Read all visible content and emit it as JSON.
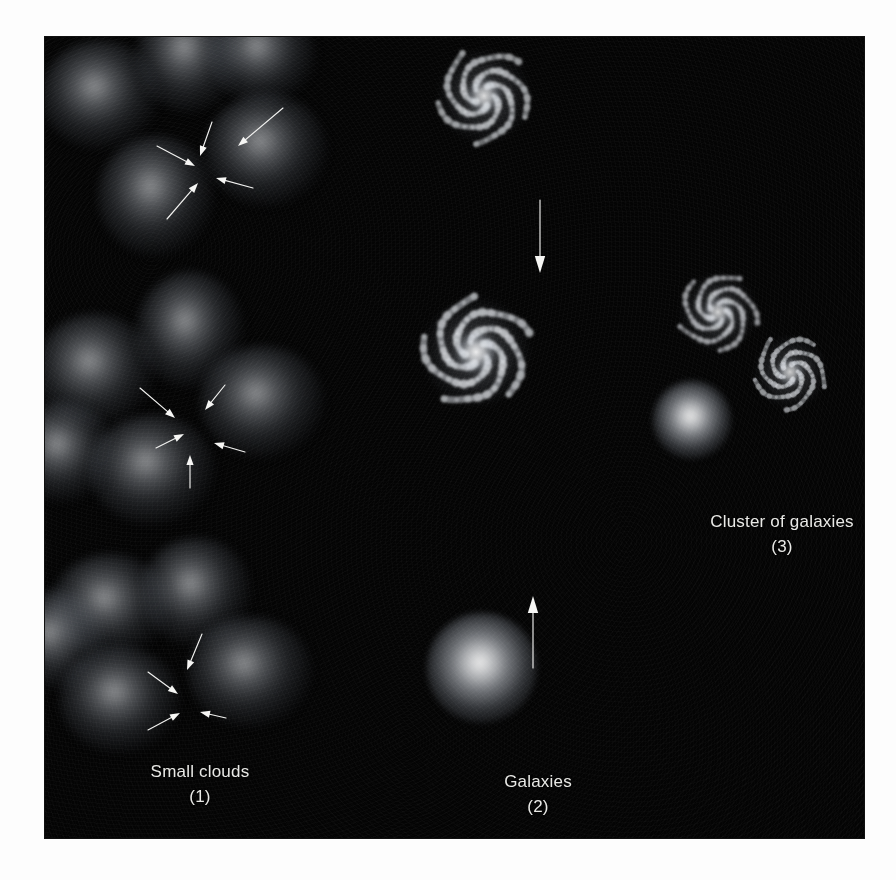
{
  "figure": {
    "background_color": "#040404",
    "page_color": "#fdfdfd",
    "text_color": "#e9e9e6",
    "panel": {
      "x": 45,
      "y": 37,
      "width": 819,
      "height": 801
    }
  },
  "captions": [
    {
      "id": "small-clouds",
      "label": "Small clouds",
      "number": "(1)",
      "x": 200,
      "y": 760
    },
    {
      "id": "galaxies",
      "label": "Galaxies",
      "number": "(2)",
      "x": 538,
      "y": 770
    },
    {
      "id": "cluster",
      "label": "Cluster of galaxies",
      "number": "(3)",
      "x": 782,
      "y": 510
    }
  ],
  "cloud_groups": [
    {
      "id": "cloud-group-1",
      "center": {
        "x": 205,
        "y": 163
      },
      "clouds": [
        {
          "x": 100,
          "y": 95,
          "w": 118,
          "h": 108
        },
        {
          "x": 189,
          "y": 56,
          "w": 104,
          "h": 114
        },
        {
          "x": 262,
          "y": 54,
          "w": 108,
          "h": 100
        },
        {
          "x": 266,
          "y": 150,
          "w": 122,
          "h": 112
        },
        {
          "x": 156,
          "y": 196,
          "w": 116,
          "h": 120
        }
      ],
      "arrows": [
        {
          "x1": 283,
          "y1": 108,
          "x2": 238,
          "y2": 146
        },
        {
          "x1": 212,
          "y1": 122,
          "x2": 200,
          "y2": 156
        },
        {
          "x1": 157,
          "y1": 146,
          "x2": 195,
          "y2": 166
        },
        {
          "x1": 167,
          "y1": 219,
          "x2": 198,
          "y2": 183
        },
        {
          "x1": 253,
          "y1": 188,
          "x2": 216,
          "y2": 178
        }
      ]
    },
    {
      "id": "cloud-group-2",
      "center": {
        "x": 188,
        "y": 434
      },
      "clouds": [
        {
          "x": 95,
          "y": 370,
          "w": 120,
          "h": 112
        },
        {
          "x": 190,
          "y": 330,
          "w": 106,
          "h": 116
        },
        {
          "x": 262,
          "y": 402,
          "w": 124,
          "h": 112
        },
        {
          "x": 152,
          "y": 470,
          "w": 126,
          "h": 110
        },
        {
          "x": 62,
          "y": 452,
          "w": 104,
          "h": 100
        }
      ],
      "arrows": [
        {
          "x1": 140,
          "y1": 388,
          "x2": 175,
          "y2": 418
        },
        {
          "x1": 225,
          "y1": 385,
          "x2": 205,
          "y2": 410
        },
        {
          "x1": 156,
          "y1": 448,
          "x2": 184,
          "y2": 434
        },
        {
          "x1": 245,
          "y1": 452,
          "x2": 214,
          "y2": 443
        },
        {
          "x1": 190,
          "y1": 488,
          "x2": 190,
          "y2": 455
        }
      ]
    },
    {
      "id": "cloud-group-3",
      "center": {
        "x": 182,
        "y": 688
      },
      "clouds": [
        {
          "x": 110,
          "y": 606,
          "w": 118,
          "h": 104
        },
        {
          "x": 196,
          "y": 592,
          "w": 110,
          "h": 108
        },
        {
          "x": 250,
          "y": 672,
          "w": 124,
          "h": 110
        },
        {
          "x": 120,
          "y": 700,
          "w": 120,
          "h": 106
        },
        {
          "x": 54,
          "y": 640,
          "w": 100,
          "h": 100
        }
      ],
      "arrows": [
        {
          "x1": 202,
          "y1": 634,
          "x2": 187,
          "y2": 670
        },
        {
          "x1": 148,
          "y1": 672,
          "x2": 178,
          "y2": 694
        },
        {
          "x1": 148,
          "y1": 730,
          "x2": 180,
          "y2": 713
        },
        {
          "x1": 226,
          "y1": 718,
          "x2": 200,
          "y2": 712
        }
      ]
    }
  ],
  "galaxies": [
    {
      "id": "galaxy-top",
      "x": 484,
      "y": 96,
      "size": 110,
      "rotation": 0,
      "arms": 5,
      "brightness": 0.85
    },
    {
      "id": "galaxy-middle",
      "x": 476,
      "y": 352,
      "size": 128,
      "rotation": 25,
      "arms": 5,
      "brightness": 0.95
    },
    {
      "id": "galaxy-cluster-top",
      "x": 718,
      "y": 312,
      "size": 92,
      "rotation": 60,
      "arms": 5,
      "brightness": 0.8
    },
    {
      "id": "galaxy-cluster-right",
      "x": 790,
      "y": 372,
      "size": 86,
      "rotation": 140,
      "arms": 5,
      "brightness": 0.78
    }
  ],
  "blobs": [
    {
      "id": "protogalaxy-bottom",
      "x": 482,
      "y": 668,
      "size": 110
    },
    {
      "id": "protogalaxy-cluster",
      "x": 692,
      "y": 420,
      "size": 78
    }
  ],
  "transition_arrows": [
    {
      "id": "galaxy-to-galaxy-arrow",
      "direction": "down",
      "x1": 540,
      "y1": 200,
      "x2": 540,
      "y2": 273
    },
    {
      "id": "blob-to-galaxy-arrow",
      "direction": "up",
      "x1": 533,
      "y1": 668,
      "x2": 533,
      "y2": 596
    }
  ]
}
